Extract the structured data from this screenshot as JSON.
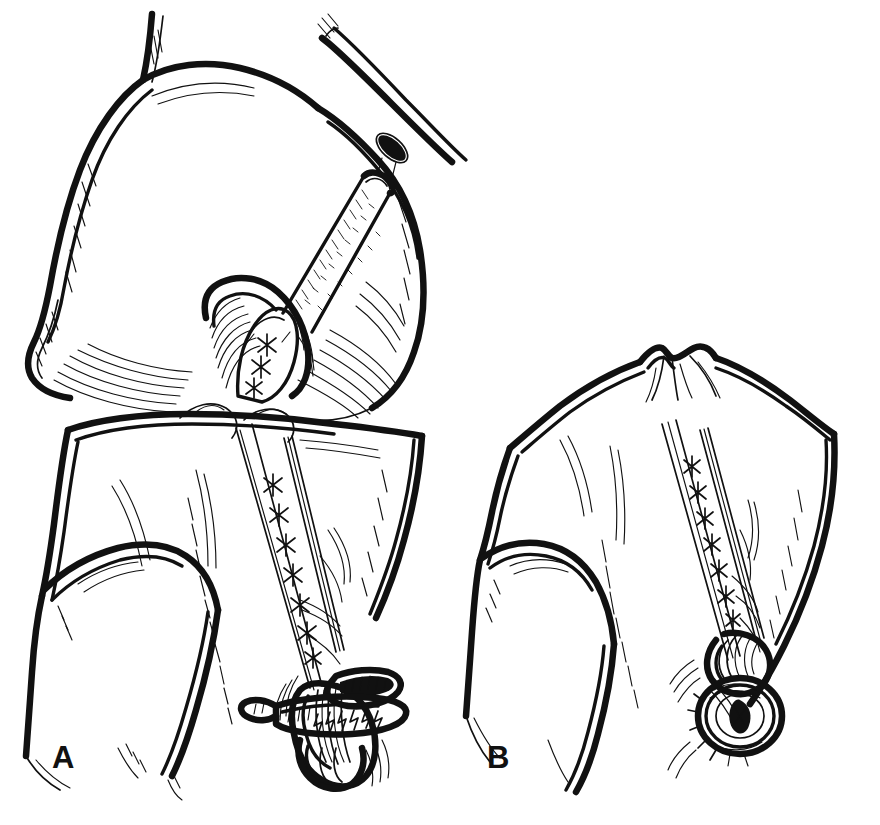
{
  "figure": {
    "kind": "line-art-medical-illustration",
    "background_color": "#ffffff",
    "ink_color": "#111111",
    "width": 880,
    "height": 825,
    "technique": "pen-and-ink cross-hatched stipple line drawing",
    "panel_count": 2
  },
  "panels": [
    {
      "id": "A",
      "label": "A",
      "label_x": 52,
      "label_y": 768,
      "view": "anterior view of flexed knee",
      "structures": [
        "medial femoral condyle",
        "lateral femoral condyle",
        "intercondylar notch",
        "femoral shaft",
        "tibial plateau",
        "proximal tibia",
        "fibular head",
        "fibula shaft"
      ],
      "instruments": [
        "graft passing strand through femoral tunnel",
        "drill guide / tunnel aperture",
        "barbed serrated staple washer fixation device"
      ],
      "suture_count": 7
    },
    {
      "id": "B",
      "label": "B",
      "label_x": 487,
      "label_y": 768,
      "view": "oblique lateral view of proximal tibia",
      "structures": [
        "tibial eminence",
        "medial tibial spine",
        "lateral tibial spine",
        "tibial plateau",
        "proximal tibia",
        "fibular head"
      ],
      "instruments": [
        "graft strand in tibial tunnel",
        "round screw head with spiked washer"
      ],
      "suture_count": 7
    }
  ],
  "labels": {
    "panel_a": "A",
    "panel_b": "B"
  },
  "chart_data": null
}
